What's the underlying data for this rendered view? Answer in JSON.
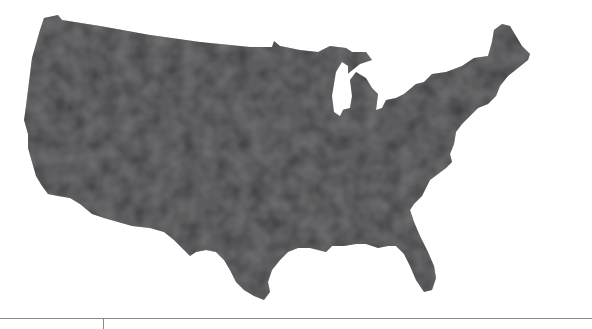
{
  "map": {
    "subject": "Contiguous United States (county-level shading)",
    "fill_color": "#3a3a3c",
    "texture_color": "#4a4a4c",
    "background_color": "#ffffff",
    "water_color": "#ffffff",
    "legend": null
  },
  "bleed_text": {
    "line1": "",
    "line2": "",
    "line3": ""
  },
  "footer": {
    "rule_color": "#8a8a8a"
  }
}
